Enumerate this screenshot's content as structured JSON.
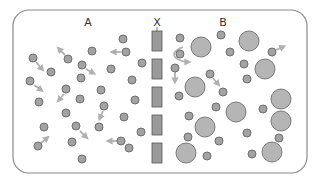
{
  "diagram": {
    "labels": {
      "left": "A",
      "membrane": "X",
      "right": "B"
    },
    "colors": {
      "frame": "#8a8a8a",
      "small_particle_fill": "#a3a3a3",
      "small_particle_stroke": "#6e6e6e",
      "large_particle_fill": "#b5b5b5",
      "large_particle_stroke": "#7a7a7a",
      "membrane_fill": "#9a9a9a",
      "membrane_stroke": "#555555",
      "arrow": "#b0b0b0"
    },
    "membrane_segments": [
      {
        "x": 152,
        "y": 31,
        "w": 10,
        "h": 20
      },
      {
        "x": 152,
        "y": 59,
        "w": 10,
        "h": 20
      },
      {
        "x": 152,
        "y": 87,
        "w": 10,
        "h": 20
      },
      {
        "x": 152,
        "y": 115,
        "w": 10,
        "h": 20
      },
      {
        "x": 152,
        "y": 143,
        "w": 10,
        "h": 20
      }
    ],
    "small_particles_A": [
      [
        33,
        58
      ],
      [
        68,
        59
      ],
      [
        51,
        72
      ],
      [
        30,
        81
      ],
      [
        66,
        89
      ],
      [
        39,
        102
      ],
      [
        66,
        113
      ],
      [
        44,
        127
      ],
      [
        38,
        146
      ],
      [
        72,
        142
      ],
      [
        76,
        126
      ],
      [
        123,
        39
      ],
      [
        126,
        52
      ],
      [
        92,
        51
      ],
      [
        82,
        65
      ],
      [
        111,
        69
      ],
      [
        142,
        63
      ],
      [
        81,
        78
      ],
      [
        132,
        80
      ],
      [
        101,
        90
      ],
      [
        80,
        99
      ],
      [
        135,
        100
      ],
      [
        104,
        106
      ],
      [
        124,
        117
      ],
      [
        99,
        127
      ],
      [
        141,
        132
      ],
      [
        121,
        141
      ],
      [
        129,
        148
      ],
      [
        82,
        159
      ]
    ],
    "small_particles_B": [
      [
        180,
        38
      ],
      [
        221,
        35
      ],
      [
        230,
        52
      ],
      [
        180,
        54
      ],
      [
        175,
        68
      ],
      [
        210,
        74
      ],
      [
        223,
        92
      ],
      [
        179,
        96
      ],
      [
        216,
        107
      ],
      [
        189,
        116
      ],
      [
        188,
        137
      ],
      [
        219,
        141
      ],
      [
        207,
        156
      ],
      [
        272,
        52
      ],
      [
        244,
        64
      ],
      [
        247,
        79
      ],
      [
        263,
        109
      ],
      [
        247,
        133
      ],
      [
        279,
        138
      ],
      [
        252,
        154
      ]
    ],
    "large_particles_B": [
      [
        201,
        47
      ],
      [
        195,
        87
      ],
      [
        205,
        127
      ],
      [
        186,
        153
      ],
      [
        236,
        112
      ],
      [
        249,
        41
      ],
      [
        265,
        69
      ],
      [
        281,
        99
      ],
      [
        281,
        121
      ],
      [
        272,
        152
      ]
    ],
    "arrows": [
      {
        "from": [
          36,
          62
        ],
        "to": [
          42,
          69
        ]
      },
      {
        "from": [
          65,
          55
        ],
        "to": [
          59,
          49
        ]
      },
      {
        "from": [
          34,
          85
        ],
        "to": [
          41,
          90
        ]
      },
      {
        "from": [
          64,
          94
        ],
        "to": [
          59,
          100
        ]
      },
      {
        "from": [
          41,
          143
        ],
        "to": [
          47,
          138
        ]
      },
      {
        "from": [
          86,
          69
        ],
        "to": [
          93,
          73
        ]
      },
      {
        "from": [
          121,
          52
        ],
        "to": [
          113,
          52
        ]
      },
      {
        "from": [
          80,
          131
        ],
        "to": [
          86,
          137
        ]
      },
      {
        "from": [
          103,
          111
        ],
        "to": [
          100,
          118
        ]
      },
      {
        "from": [
          117,
          141
        ],
        "to": [
          109,
          141
        ]
      },
      {
        "from": [
          175,
          72
        ],
        "to": [
          175,
          81
        ]
      },
      {
        "from": [
          213,
          78
        ],
        "to": [
          218,
          84
        ]
      },
      {
        "from": [
          276,
          50
        ],
        "to": [
          283,
          47
        ]
      }
    ],
    "curved_arrow": {
      "d": "M183 47 Q170 52 176 58 Q182 62 188 62"
    }
  }
}
